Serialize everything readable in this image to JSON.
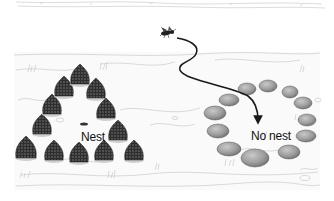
{
  "figure": {
    "type": "illustration",
    "labels": {
      "nest": "Nest",
      "no_nest": "No nest"
    },
    "elements": {
      "wasp": "wasp-icon",
      "flight_path": "curved arrow from wasp to center of stone ring",
      "left_ring": "ring of pine cones surrounding nest",
      "right_ring": "ring of stones with no nest"
    },
    "colors": {
      "background": "#ffffff",
      "ground_sketch": "#bdbdbd",
      "pine_cone": "#3a3a3a",
      "stone": "#9a9a9a",
      "arrow": "#1a1a1a"
    }
  }
}
